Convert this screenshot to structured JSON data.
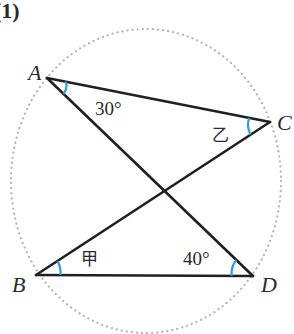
{
  "figure": {
    "label": "(1)"
  },
  "colors": {
    "line": "#231f20",
    "arc": "#2a9fd8",
    "circle": "#b3b3b3",
    "text": "#2a2a2a"
  },
  "points": {
    "A": {
      "label": "A",
      "x": 47,
      "y": 78
    },
    "B": {
      "label": "B",
      "x": 36,
      "y": 275
    },
    "C": {
      "label": "C",
      "x": 270,
      "y": 122
    },
    "D": {
      "label": "D",
      "x": 253,
      "y": 276
    }
  },
  "segments": [
    "AC",
    "AD",
    "CB",
    "BD"
  ],
  "circle": {
    "cx": 146,
    "cy": 181,
    "rx": 135,
    "ry": 152,
    "style": "dotted"
  },
  "angles": {
    "A": {
      "text": "30°"
    },
    "C": {
      "text": "乙"
    },
    "B": {
      "text": "甲"
    },
    "D": {
      "text": "40°"
    }
  }
}
